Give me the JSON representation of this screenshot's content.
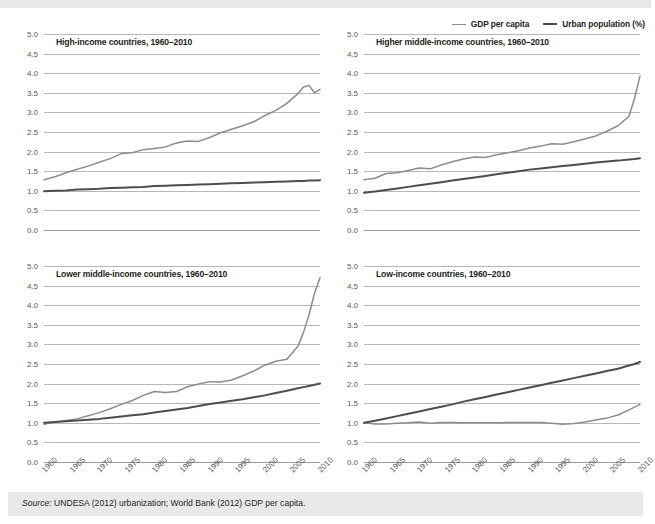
{
  "figure": {
    "legend": {
      "position": "top-right",
      "entries": [
        {
          "name": "gdp",
          "label": "GDP per capita",
          "color": "#8c8c8c"
        },
        {
          "name": "urban",
          "label": "Urban population (%)",
          "color": "#4d4d4d"
        }
      ]
    },
    "source": {
      "label": "Source:",
      "text": " UNDESA (2012) urbanization; World Bank (2012) GDP per capita."
    }
  },
  "chart_data": [
    {
      "type": "line",
      "title": "High-income countries, 1960–2010",
      "xlabel": "",
      "ylabel": "",
      "xlim": [
        1960,
        2010
      ],
      "ylim": [
        0.0,
        5.0
      ],
      "grid": true,
      "yticks": [
        "5.0",
        "4.5",
        "4.0",
        "3.5",
        "3.0",
        "2.5",
        "2.0",
        "1.5",
        "1.0",
        "0.5",
        "0.0"
      ],
      "xticks": [
        "1960",
        "1965",
        "1970",
        "1975",
        "1980",
        "1985",
        "1990",
        "1995",
        "2000",
        "2005",
        "2010"
      ],
      "x": [
        1960,
        1962,
        1964,
        1966,
        1968,
        1970,
        1972,
        1974,
        1976,
        1978,
        1980,
        1982,
        1984,
        1986,
        1988,
        1990,
        1992,
        1994,
        1996,
        1998,
        2000,
        2002,
        2004,
        2006,
        2007,
        2008,
        2009,
        2010
      ],
      "series": [
        {
          "name": "GDP per capita",
          "color": "#8c8c8c",
          "values": [
            1.28,
            1.36,
            1.46,
            1.55,
            1.63,
            1.73,
            1.82,
            1.95,
            1.97,
            2.05,
            2.08,
            2.12,
            2.22,
            2.27,
            2.26,
            2.36,
            2.48,
            2.57,
            2.66,
            2.76,
            2.92,
            3.05,
            3.23,
            3.48,
            3.65,
            3.69,
            3.5,
            3.59
          ]
        },
        {
          "name": "Urban population (%)",
          "color": "#4d4d4d",
          "values": [
            0.99,
            1.0,
            1.01,
            1.03,
            1.04,
            1.05,
            1.07,
            1.08,
            1.09,
            1.1,
            1.12,
            1.13,
            1.14,
            1.15,
            1.16,
            1.17,
            1.18,
            1.19,
            1.2,
            1.21,
            1.22,
            1.23,
            1.24,
            1.25,
            1.25,
            1.26,
            1.26,
            1.27
          ]
        }
      ]
    },
    {
      "type": "line",
      "title": "Higher middle-income countries, 1960–2010",
      "xlabel": "",
      "ylabel": "",
      "xlim": [
        1960,
        2010
      ],
      "ylim": [
        0.0,
        5.0
      ],
      "grid": true,
      "yticks": [
        "5.0",
        "4.5",
        "4.0",
        "3.5",
        "3.0",
        "2.5",
        "2.0",
        "1.5",
        "1.0",
        "0.5",
        "0.0"
      ],
      "xticks": [
        "1960",
        "1965",
        "1970",
        "1975",
        "1980",
        "1985",
        "1990",
        "1995",
        "2000",
        "2005",
        "2010"
      ],
      "x": [
        1960,
        1962,
        1964,
        1966,
        1968,
        1970,
        1972,
        1974,
        1976,
        1978,
        1980,
        1982,
        1984,
        1986,
        1988,
        1990,
        1992,
        1994,
        1996,
        1998,
        2000,
        2002,
        2004,
        2006,
        2008,
        2009,
        2010
      ],
      "series": [
        {
          "name": "GDP per capita",
          "color": "#8c8c8c",
          "values": [
            1.28,
            1.32,
            1.44,
            1.46,
            1.52,
            1.58,
            1.56,
            1.66,
            1.74,
            1.81,
            1.86,
            1.85,
            1.92,
            1.97,
            2.02,
            2.09,
            2.14,
            2.2,
            2.19,
            2.25,
            2.32,
            2.4,
            2.52,
            2.66,
            2.9,
            3.35,
            3.93
          ]
        },
        {
          "name": "Urban population (%)",
          "color": "#4d4d4d",
          "values": [
            0.95,
            0.98,
            1.02,
            1.06,
            1.1,
            1.14,
            1.18,
            1.22,
            1.26,
            1.3,
            1.34,
            1.38,
            1.42,
            1.46,
            1.5,
            1.54,
            1.57,
            1.6,
            1.63,
            1.66,
            1.69,
            1.72,
            1.75,
            1.77,
            1.8,
            1.81,
            1.83
          ]
        }
      ]
    },
    {
      "type": "line",
      "title": "Lower middle-income countries, 1960–2010",
      "xlabel": "",
      "ylabel": "",
      "xlim": [
        1960,
        2010
      ],
      "ylim": [
        0.0,
        5.0
      ],
      "grid": true,
      "yticks": [
        "5.0",
        "4.5",
        "4.0",
        "3.5",
        "3.0",
        "2.5",
        "2.0",
        "1.5",
        "1.0",
        "0.5",
        "0.0"
      ],
      "xticks": [
        "1960",
        "1965",
        "1970",
        "1975",
        "1980",
        "1985",
        "1990",
        "1995",
        "2000",
        "2005",
        "2010"
      ],
      "x": [
        1960,
        1962,
        1964,
        1966,
        1968,
        1970,
        1972,
        1974,
        1976,
        1978,
        1980,
        1982,
        1984,
        1986,
        1988,
        1990,
        1992,
        1994,
        1996,
        1998,
        2000,
        2002,
        2004,
        2006,
        2007,
        2008,
        2009,
        2010
      ],
      "series": [
        {
          "name": "GDP per capita",
          "color": "#8c8c8c",
          "values": [
            0.96,
            1.02,
            1.06,
            1.1,
            1.18,
            1.26,
            1.36,
            1.47,
            1.57,
            1.7,
            1.8,
            1.77,
            1.8,
            1.92,
            1.99,
            2.05,
            2.04,
            2.09,
            2.2,
            2.32,
            2.47,
            2.57,
            2.62,
            2.95,
            3.3,
            3.75,
            4.3,
            4.7
          ]
        },
        {
          "name": "Urban population (%)",
          "color": "#4d4d4d",
          "values": [
            1.0,
            1.02,
            1.04,
            1.06,
            1.08,
            1.1,
            1.13,
            1.16,
            1.19,
            1.22,
            1.26,
            1.3,
            1.34,
            1.38,
            1.43,
            1.48,
            1.52,
            1.56,
            1.6,
            1.65,
            1.7,
            1.76,
            1.82,
            1.88,
            1.91,
            1.94,
            1.97,
            2.0
          ]
        }
      ]
    },
    {
      "type": "line",
      "title": "Low-income countries, 1960–2010",
      "xlabel": "",
      "ylabel": "",
      "xlim": [
        1960,
        2010
      ],
      "ylim": [
        0.0,
        5.0
      ],
      "grid": true,
      "yticks": [
        "5.0",
        "4.5",
        "4.0",
        "3.5",
        "3.0",
        "2.5",
        "2.0",
        "1.5",
        "1.0",
        "0.5",
        "0.0"
      ],
      "xticks": [
        "1960",
        "1965",
        "1970",
        "1975",
        "1980",
        "1985",
        "1990",
        "1995",
        "2000",
        "2005",
        "2010"
      ],
      "x": [
        1960,
        1962,
        1964,
        1966,
        1968,
        1970,
        1972,
        1974,
        1976,
        1978,
        1980,
        1982,
        1984,
        1986,
        1988,
        1990,
        1992,
        1994,
        1996,
        1998,
        2000,
        2002,
        2004,
        2006,
        2008,
        2009,
        2010
      ],
      "series": [
        {
          "name": "GDP per capita",
          "color": "#8c8c8c",
          "values": [
            1.0,
            0.97,
            0.97,
            0.99,
            1.0,
            1.02,
            0.99,
            1.01,
            1.01,
            1.0,
            1.0,
            1.0,
            1.0,
            1.01,
            1.01,
            1.01,
            1.01,
            0.99,
            0.96,
            0.98,
            1.02,
            1.07,
            1.12,
            1.2,
            1.33,
            1.4,
            1.47
          ]
        },
        {
          "name": "Urban population (%)",
          "color": "#4d4d4d",
          "values": [
            1.0,
            1.05,
            1.11,
            1.17,
            1.23,
            1.29,
            1.35,
            1.41,
            1.47,
            1.54,
            1.6,
            1.66,
            1.72,
            1.78,
            1.84,
            1.9,
            1.96,
            2.02,
            2.08,
            2.14,
            2.2,
            2.26,
            2.32,
            2.38,
            2.46,
            2.5,
            2.55
          ]
        }
      ]
    }
  ]
}
